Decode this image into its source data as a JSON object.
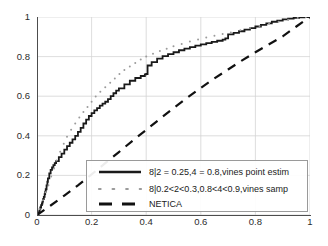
{
  "chart_data": {
    "type": "line",
    "title": "",
    "xlabel": "",
    "ylabel": "",
    "xlim": [
      0,
      1
    ],
    "ylim": [
      0,
      1
    ],
    "grid": true,
    "legend_position": "lower right",
    "xticks": [
      "0",
      "0.2",
      "0.4",
      "0.6",
      "0.8",
      "1"
    ],
    "yticks": [
      "0",
      "0.2",
      "0.4",
      "0.6",
      "0.8",
      "1"
    ],
    "xtick_values": [
      0,
      0.2,
      0.4,
      0.6,
      0.8,
      1
    ],
    "ytick_values": [
      0,
      0.2,
      0.4,
      0.6,
      0.8,
      1
    ],
    "series": [
      {
        "name": "8|2 = 0.25,4 = 0.8,vines point estim",
        "style": "solid",
        "color": "#1a1a1a",
        "width": 1.8,
        "x": [
          0.0,
          0.005,
          0.008,
          0.01,
          0.012,
          0.015,
          0.018,
          0.02,
          0.022,
          0.025,
          0.028,
          0.03,
          0.032,
          0.035,
          0.038,
          0.04,
          0.045,
          0.05,
          0.055,
          0.06,
          0.065,
          0.07,
          0.08,
          0.09,
          0.1,
          0.11,
          0.12,
          0.13,
          0.14,
          0.15,
          0.16,
          0.17,
          0.18,
          0.19,
          0.2,
          0.21,
          0.22,
          0.23,
          0.24,
          0.25,
          0.26,
          0.27,
          0.28,
          0.29,
          0.3,
          0.32,
          0.34,
          0.36,
          0.38,
          0.395,
          0.4,
          0.405,
          0.42,
          0.44,
          0.46,
          0.48,
          0.5,
          0.52,
          0.54,
          0.56,
          0.58,
          0.6,
          0.62,
          0.64,
          0.66,
          0.68,
          0.69,
          0.7,
          0.72,
          0.74,
          0.76,
          0.78,
          0.8,
          0.82,
          0.84,
          0.86,
          0.88,
          0.9,
          0.92,
          0.94,
          0.96,
          0.98,
          1.0
        ],
        "y": [
          0.0,
          0.012,
          0.02,
          0.03,
          0.038,
          0.05,
          0.058,
          0.068,
          0.08,
          0.092,
          0.105,
          0.118,
          0.13,
          0.15,
          0.168,
          0.185,
          0.21,
          0.228,
          0.24,
          0.252,
          0.262,
          0.272,
          0.292,
          0.31,
          0.33,
          0.348,
          0.365,
          0.382,
          0.4,
          0.42,
          0.44,
          0.462,
          0.482,
          0.5,
          0.515,
          0.528,
          0.54,
          0.552,
          0.562,
          0.572,
          0.585,
          0.6,
          0.615,
          0.628,
          0.64,
          0.66,
          0.678,
          0.692,
          0.702,
          0.71,
          0.712,
          0.755,
          0.772,
          0.79,
          0.802,
          0.812,
          0.822,
          0.832,
          0.84,
          0.848,
          0.855,
          0.862,
          0.868,
          0.874,
          0.88,
          0.886,
          0.892,
          0.912,
          0.92,
          0.928,
          0.936,
          0.944,
          0.952,
          0.96,
          0.968,
          0.976,
          0.982,
          0.988,
          0.992,
          0.996,
          0.998,
          0.999,
          1.0
        ]
      },
      {
        "name": "8|0.2<2<0.3,0.8<4<0.9,vines samp",
        "style": "dotted",
        "color": "#9b9b9b",
        "width": 1.8,
        "x": [
          0.01,
          0.022,
          0.032,
          0.042,
          0.052,
          0.062,
          0.072,
          0.085,
          0.098,
          0.11,
          0.125,
          0.14,
          0.155,
          0.17,
          0.185,
          0.2,
          0.215,
          0.232,
          0.25,
          0.268,
          0.285,
          0.302,
          0.32,
          0.34,
          0.36,
          0.38,
          0.4,
          0.425,
          0.45,
          0.475,
          0.5,
          0.53,
          0.56,
          0.59,
          0.62,
          0.65,
          0.68,
          0.71,
          0.745,
          0.78,
          0.815,
          0.85,
          0.885,
          0.92,
          0.955,
          0.985
        ],
        "y": [
          0.03,
          0.075,
          0.115,
          0.15,
          0.195,
          0.235,
          0.275,
          0.32,
          0.36,
          0.395,
          0.43,
          0.462,
          0.492,
          0.52,
          0.545,
          0.572,
          0.598,
          0.622,
          0.645,
          0.668,
          0.69,
          0.712,
          0.732,
          0.75,
          0.768,
          0.785,
          0.8,
          0.815,
          0.828,
          0.84,
          0.852,
          0.864,
          0.876,
          0.886,
          0.896,
          0.905,
          0.914,
          0.922,
          0.933,
          0.944,
          0.955,
          0.966,
          0.976,
          0.986,
          0.995,
          1.0
        ]
      },
      {
        "name": "NETICA",
        "style": "dashed",
        "color": "#111111",
        "width": 2.2,
        "x": [
          0.0,
          0.05,
          0.1,
          0.15,
          0.2,
          0.25,
          0.3,
          0.35,
          0.4,
          0.45,
          0.5,
          0.55,
          0.6,
          0.65,
          0.7,
          0.75,
          0.8,
          0.85,
          0.9,
          0.95,
          1.0
        ],
        "y": [
          0.0,
          0.048,
          0.098,
          0.15,
          0.205,
          0.262,
          0.318,
          0.375,
          0.43,
          0.485,
          0.54,
          0.592,
          0.642,
          0.69,
          0.735,
          0.78,
          0.822,
          0.862,
          0.902,
          0.952,
          1.0
        ]
      }
    ]
  },
  "legend": {
    "entries": [
      {
        "label": "8|2 = 0.25,4 = 0.8,vines point estim",
        "style": "solid"
      },
      {
        "label": "8|0.2<2<0.3,0.8<4<0.9,vines samp",
        "style": "dotted"
      },
      {
        "label": "NETICA",
        "style": "dashed"
      }
    ]
  },
  "colors": {
    "solid": "#1a1a1a",
    "dotted": "#9b9b9b",
    "dashed": "#111111",
    "grid": "#d4d4d4",
    "axis": "#4d4d4d"
  }
}
